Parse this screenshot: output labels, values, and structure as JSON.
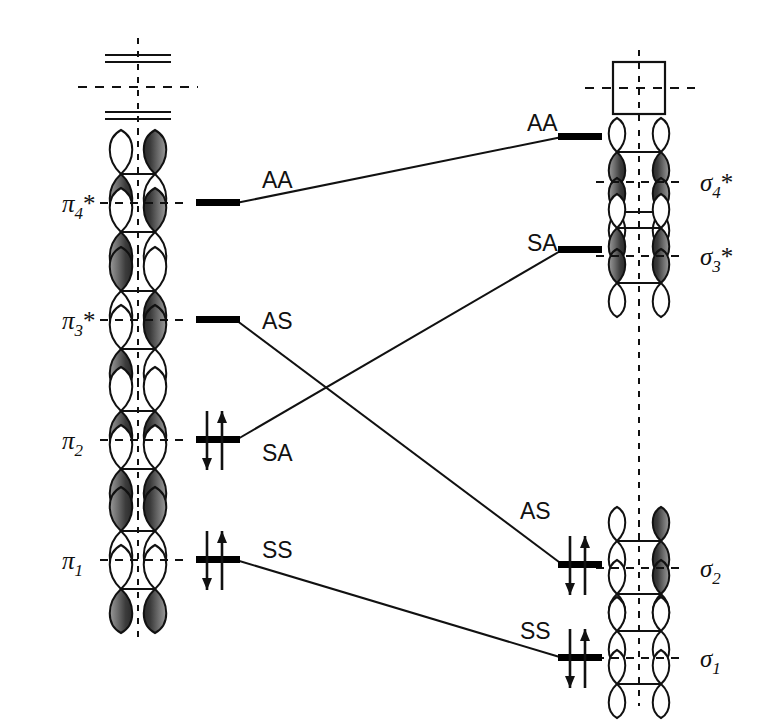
{
  "figure": {
    "line_color": "#111111",
    "level_color": "#000000",
    "lobe_fill_dark": "#555555",
    "lobe_fill_light": "#ffffff"
  },
  "left_side": {
    "name": "butadiene-pi-orbitals",
    "levels": [
      {
        "id": "pi4star",
        "label_base": "π",
        "label_sub": "4",
        "label_star": "*",
        "label_text": "π4*",
        "energy_y": 203,
        "electrons": 0,
        "nodes": "3"
      },
      {
        "id": "pi3star",
        "label_base": "π",
        "label_sub": "3",
        "label_star": "*",
        "label_text": "π3*",
        "energy_y": 320,
        "electrons": 0,
        "nodes": "2"
      },
      {
        "id": "pi2",
        "label_base": "π",
        "label_sub": "2",
        "label_star": "",
        "label_text": "π2",
        "energy_y": 440,
        "electrons": 2,
        "nodes": "1"
      },
      {
        "id": "pi1",
        "label_base": "π",
        "label_sub": "1",
        "label_star": "",
        "label_text": "π1",
        "energy_y": 560,
        "electrons": 2,
        "nodes": "0"
      }
    ]
  },
  "right_side": {
    "name": "cyclobutene-sigma-orbitals",
    "levels": [
      {
        "id": "sigma4star",
        "label_base": "σ",
        "label_sub": "4",
        "label_star": "*",
        "label_text": "σ4*",
        "energy_y": 137,
        "electrons": 0
      },
      {
        "id": "sigma3star",
        "label_base": "σ",
        "label_sub": "3",
        "label_star": "*",
        "label_text": "σ3*",
        "energy_y": 250,
        "electrons": 0
      },
      {
        "id": "sigma2",
        "label_base": "σ",
        "label_sub": "2",
        "label_star": "",
        "label_text": "σ2",
        "energy_y": 565,
        "electrons": 2
      },
      {
        "id": "sigma1",
        "label_base": "σ",
        "label_sub": "1",
        "label_star": "",
        "label_text": "σ1",
        "energy_y": 658,
        "electrons": 2
      }
    ]
  },
  "correlations": [
    {
      "id": "corr-aa",
      "from": "pi4star",
      "to": "sigma4star",
      "left_label": "AA",
      "right_label": "AA",
      "left_label_x": 262,
      "left_label_y": 180,
      "right_label_x": 527,
      "right_label_y": 131
    },
    {
      "id": "corr-as",
      "from": "pi3star",
      "to": "sigma2",
      "left_label": "AS",
      "right_label": "AS",
      "left_label_x": 262,
      "left_label_y": 322,
      "right_label_x": 520,
      "right_label_y": 512
    },
    {
      "id": "corr-sa",
      "from": "pi2",
      "to": "sigma3star",
      "left_label": "SA",
      "right_label": "SA",
      "left_label_x": 262,
      "left_label_y": 455,
      "right_label_x": 527,
      "right_label_y": 245
    },
    {
      "id": "corr-ss",
      "from": "pi1",
      "to": "sigma1",
      "left_label": "SS",
      "right_label": "SS",
      "left_label_x": 262,
      "left_label_y": 552,
      "right_label_x": 520,
      "right_label_y": 632
    }
  ],
  "structures": {
    "butadiene_top": {
      "name": "butadiene-skeleton",
      "description": "two horizontal double-bond pairs with vertical dashed mirror plane"
    },
    "cyclobutene_top": {
      "name": "cyclobutene-square",
      "description": "square ring with vertical and horizontal dashed mirror lines"
    }
  }
}
